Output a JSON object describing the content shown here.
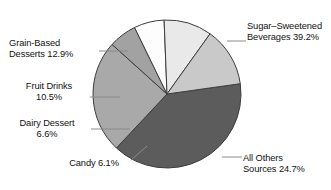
{
  "chart_data": {
    "type": "pie",
    "title": "",
    "subtitle": "",
    "xlabel": "",
    "ylabel": "",
    "legend_position": "none",
    "grid": false,
    "units": "percent",
    "categories": [
      "Sugar–Sweetened Beverages",
      "All Others Sources",
      "Candy",
      "Dairy Dessert",
      "Fruit Drinks",
      "Grain-Based Desserts"
    ],
    "values": [
      39.2,
      24.7,
      6.1,
      6.6,
      10.5,
      12.9
    ],
    "slices": [
      {
        "name": "sugar-sweetened-beverages",
        "label_line1": "Sugar–Sweetened",
        "label_line2": "Beverages 39.2%",
        "value": 39.2,
        "value_text": "39.2%",
        "color": "#5c5c5c"
      },
      {
        "name": "all-other-sources",
        "label_line1": "All Others",
        "label_line2": "Sources 24.7%",
        "value": 24.7,
        "value_text": "24.7%",
        "color": "#a9a9a9"
      },
      {
        "name": "candy",
        "label_line1": "Candy 6.1%",
        "label_line2": "",
        "value": 6.1,
        "value_text": "6.1%",
        "color": "#a2a2a2"
      },
      {
        "name": "dairy-dessert",
        "label_line1": "Dairy Dessert",
        "label_line2": "6.6%",
        "value": 6.6,
        "value_text": "6.6%",
        "color": "#fdfdfd"
      },
      {
        "name": "fruit-drinks",
        "label_line1": "Fruit Drinks",
        "label_line2": "10.5%",
        "value": 10.5,
        "value_text": "10.5%",
        "color": "#e9e9e9"
      },
      {
        "name": "grain-based-desserts",
        "label_line1": "Grain-Based",
        "label_line2": "Desserts 12.9%",
        "value": 12.9,
        "value_text": "12.9%",
        "color": "#c9c9c9"
      }
    ],
    "geometry": {
      "center_x": 167,
      "center_y": 94,
      "radius": 74,
      "start_angle_deg": -8
    },
    "colors": {
      "outline": "#3d3d3d",
      "leader_line": "#8a8a8a",
      "background": "#ffffff",
      "text": "#121212"
    }
  }
}
